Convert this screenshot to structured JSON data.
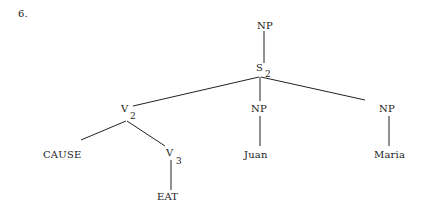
{
  "example_number": "6.",
  "tree": {
    "nodes": {
      "np_top": {
        "label": "NP"
      },
      "s2": {
        "label": "S",
        "subscript": "2"
      },
      "v2": {
        "label": "V",
        "subscript": "2"
      },
      "np_juan": {
        "label": "NP"
      },
      "np_maria": {
        "label": "NP"
      },
      "cause": {
        "label": "CAUSE"
      },
      "v3": {
        "label": "V",
        "subscript": "3"
      },
      "juan": {
        "label": "Juan"
      },
      "maria": {
        "label": "Maria"
      },
      "eat": {
        "label": "EAT"
      }
    },
    "edges": [
      [
        "np_top",
        "s2"
      ],
      [
        "s2",
        "v2"
      ],
      [
        "s2",
        "np_juan"
      ],
      [
        "s2",
        "np_maria"
      ],
      [
        "v2",
        "cause"
      ],
      [
        "v2",
        "v3"
      ],
      [
        "v3",
        "eat"
      ],
      [
        "np_juan",
        "juan"
      ],
      [
        "np_maria",
        "maria"
      ]
    ]
  }
}
